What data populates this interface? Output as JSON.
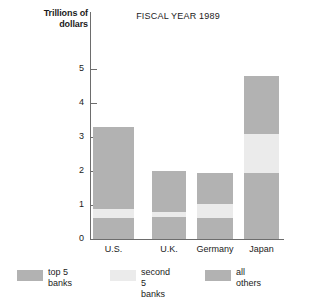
{
  "chart_data": {
    "type": "bar",
    "title": "FISCAL YEAR 1989",
    "subtitle": "",
    "xlabel": "",
    "ylabel": "Trillions of\ndollars",
    "ylabel_line1": "Trillions of",
    "ylabel_line2": "dollars",
    "categories": [
      "U.S.",
      "U.K.",
      "Germany",
      "Japan"
    ],
    "stacked": true,
    "stack_order_bottom_to_top": [
      "all others",
      "second 5 banks",
      "top 5 banks"
    ],
    "series": [
      {
        "name": "all others",
        "color": "#b2b2b2",
        "values": [
          0.62,
          0.65,
          0.62,
          1.95
        ]
      },
      {
        "name": "second 5 banks",
        "color": "#ebebeb",
        "values": [
          0.26,
          0.13,
          0.4,
          1.15
        ]
      },
      {
        "name": "top 5 banks",
        "color": "#b2b2b2",
        "values": [
          2.42,
          1.22,
          0.93,
          1.7
        ]
      }
    ],
    "totals": [
      3.3,
      2.0,
      1.95,
      4.8
    ],
    "ylim": [
      0,
      5.4
    ],
    "yticks": [
      0,
      1,
      2,
      3,
      4,
      5
    ],
    "ytick_labels": [
      "0",
      "1",
      "2",
      "3",
      "4",
      "5"
    ],
    "grid": false,
    "legend_position": "bottom"
  },
  "axis": {
    "ticks": [
      {
        "label": "5",
        "value": 5
      },
      {
        "label": "4",
        "value": 4
      },
      {
        "label": "3",
        "value": 3
      },
      {
        "label": "2",
        "value": 2
      },
      {
        "label": "1",
        "value": 1
      },
      {
        "label": "0",
        "value": 0
      }
    ]
  },
  "bars": [
    {
      "category": "U.S.",
      "segments": [
        {
          "name": "all others",
          "bottom": 0.0,
          "top": 0.62,
          "tone": "dark"
        },
        {
          "name": "second 5 banks",
          "bottom": 0.62,
          "top": 0.88,
          "tone": "light"
        },
        {
          "name": "top 5 banks",
          "bottom": 0.88,
          "top": 3.3,
          "tone": "dark"
        }
      ]
    },
    {
      "category": "U.K.",
      "segments": [
        {
          "name": "all others",
          "bottom": 0.0,
          "top": 0.65,
          "tone": "dark"
        },
        {
          "name": "second 5 banks",
          "bottom": 0.65,
          "top": 0.78,
          "tone": "light"
        },
        {
          "name": "top 5 banks",
          "bottom": 0.78,
          "top": 2.0,
          "tone": "dark"
        }
      ]
    },
    {
      "category": "Germany",
      "segments": [
        {
          "name": "all others",
          "bottom": 0.0,
          "top": 0.62,
          "tone": "dark"
        },
        {
          "name": "second 5 banks",
          "bottom": 0.62,
          "top": 1.02,
          "tone": "light"
        },
        {
          "name": "top 5 banks",
          "bottom": 1.02,
          "top": 1.95,
          "tone": "dark"
        }
      ]
    },
    {
      "category": "Japan",
      "segments": [
        {
          "name": "all others",
          "bottom": 0.0,
          "top": 1.95,
          "tone": "dark"
        },
        {
          "name": "second 5 banks",
          "bottom": 1.95,
          "top": 3.1,
          "tone": "light"
        },
        {
          "name": "top 5 banks",
          "bottom": 3.1,
          "top": 4.8,
          "tone": "dark"
        }
      ]
    }
  ],
  "legend": {
    "items": [
      {
        "label_line1": "top 5",
        "label_line2": "banks",
        "tone": "dark",
        "color": "#b2b2b2"
      },
      {
        "label_line1": "second",
        "label_line2": "5 banks",
        "tone": "light",
        "color": "#ebebeb"
      },
      {
        "label_line1": "all",
        "label_line2": "others",
        "tone": "dark",
        "color": "#b2b2b2"
      }
    ]
  },
  "colors": {
    "bar_dark": "#b2b2b2",
    "bar_light": "#ebebeb",
    "axis": "#6d6d6d",
    "text": "#1b1b1b",
    "background": "#ffffff"
  }
}
